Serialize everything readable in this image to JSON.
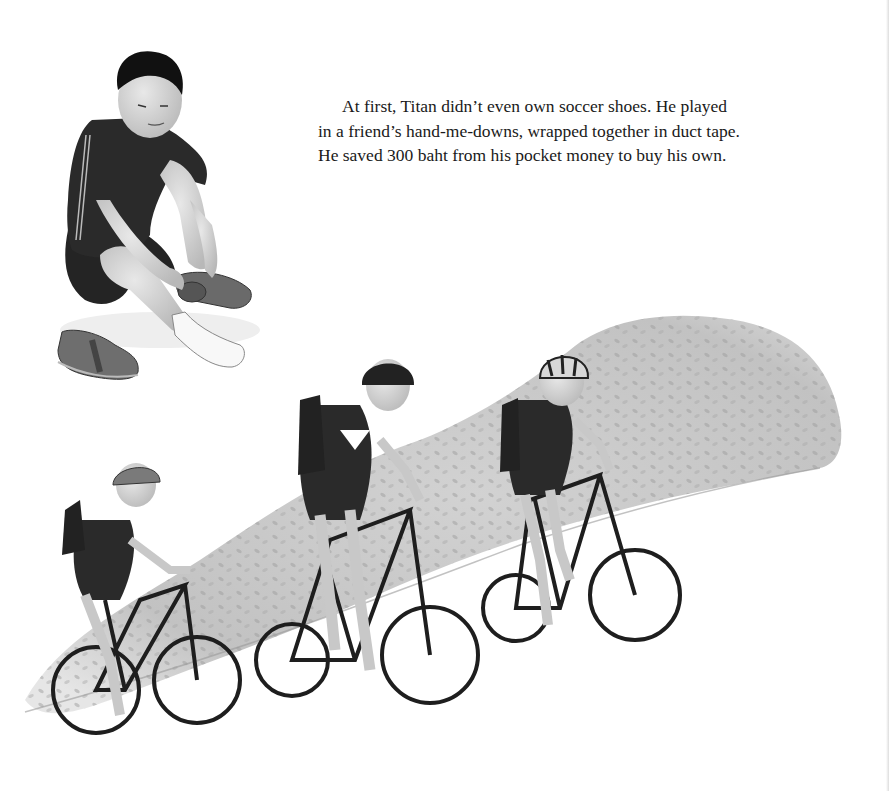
{
  "page": {
    "story_text": {
      "lines": [
        "At first, Titan didn’t even own soccer shoes. He played",
        "in a friend’s hand-me-downs, wrapped together in duct tape.",
        "He saved 300 baht from his pocket money to buy his own."
      ]
    },
    "illustration": {
      "boy_sitting": "boy-putting-on-shoe",
      "loose_shoe": "shoe",
      "bushes": "hedge",
      "cyclists": [
        "cyclist-left",
        "cyclist-middle",
        "cyclist-right"
      ]
    },
    "colors": {
      "background": "#ffffff",
      "text": "#1a1a1a",
      "shirt": "#2b2b2b",
      "skin": "#cfcfcf",
      "hedge": "#bdbdbd",
      "bike": "#1e1e1e"
    }
  }
}
